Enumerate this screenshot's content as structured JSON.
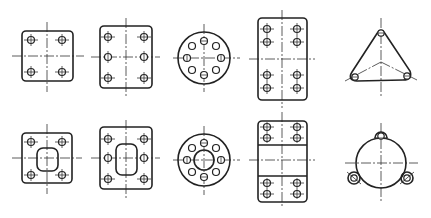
{
  "title": "Bolt hole arrangement patterns",
  "colors": {
    "line": "#222222",
    "background": "#ffffff"
  },
  "figures": [
    {
      "id": "square-4-holes",
      "shape": "rounded-square",
      "holes": 4,
      "layout": "2x2 grid",
      "inner_opening": "none"
    },
    {
      "id": "rect-6-holes",
      "shape": "rounded-rectangle",
      "holes": 6,
      "layout": "2 columns x 3 rows",
      "inner_opening": "none"
    },
    {
      "id": "circle-8-holes",
      "shape": "circle",
      "holes": 8,
      "layout": "bolt circle",
      "inner_opening": "none"
    },
    {
      "id": "rect-8-holes-paired",
      "shape": "rounded-rectangle",
      "holes": 8,
      "layout": "2 columns x 2 pairs",
      "inner_opening": "none"
    },
    {
      "id": "triangle-3-holes",
      "shape": "rounded-triangle",
      "holes": 3,
      "layout": "120-degree",
      "inner_opening": "none"
    },
    {
      "id": "square-4-holes-opening",
      "shape": "rounded-square",
      "holes": 4,
      "layout": "2x2 grid",
      "inner_opening": "rounded-square"
    },
    {
      "id": "rect-6-holes-opening",
      "shape": "rounded-rectangle",
      "holes": 6,
      "layout": "2 columns x 3 rows",
      "inner_opening": "rounded-rectangle"
    },
    {
      "id": "ring-8-holes",
      "shape": "circle",
      "holes": 8,
      "layout": "bolt circle",
      "inner_opening": "circle"
    },
    {
      "id": "rect-8-holes-split",
      "shape": "rounded-rectangle",
      "holes": 8,
      "layout": "2 columns x 2 pairs, split bands",
      "inner_opening": "none"
    },
    {
      "id": "circle-3-lugs",
      "shape": "circle",
      "holes": 3,
      "layout": "120-degree lugs",
      "inner_opening": "none"
    }
  ]
}
